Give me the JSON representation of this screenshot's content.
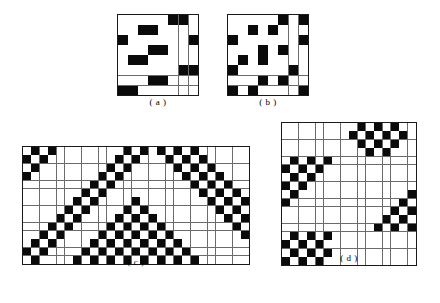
{
  "figure": {
    "background_color": "#ffffff",
    "cell_on_color": "#0a0a0a",
    "cell_off_color": "#ffffff",
    "gridline_color": "#6b6b6b",
    "border_color": "#1a1a1a"
  },
  "panels": [
    {
      "id": "a",
      "caption": "( a )",
      "rows": 8,
      "cols": 8,
      "cell_size": 9.5,
      "matrix": [
        [
          0,
          0,
          0,
          0,
          0,
          1,
          1,
          0
        ],
        [
          0,
          0,
          1,
          1,
          0,
          0,
          0,
          0
        ],
        [
          1,
          0,
          0,
          0,
          0,
          0,
          0,
          1
        ],
        [
          0,
          0,
          0,
          1,
          1,
          0,
          0,
          0
        ],
        [
          0,
          1,
          1,
          0,
          0,
          0,
          0,
          0
        ],
        [
          0,
          0,
          0,
          0,
          0,
          0,
          1,
          1
        ],
        [
          0,
          0,
          0,
          1,
          1,
          0,
          0,
          0
        ],
        [
          1,
          1,
          0,
          0,
          0,
          0,
          0,
          0
        ]
      ]
    },
    {
      "id": "b",
      "caption": "( b )",
      "rows": 8,
      "cols": 8,
      "cell_size": 9.5,
      "matrix": [
        [
          0,
          0,
          0,
          0,
          0,
          1,
          0,
          1
        ],
        [
          0,
          0,
          1,
          0,
          1,
          0,
          0,
          0
        ],
        [
          1,
          0,
          0,
          0,
          0,
          0,
          0,
          1
        ],
        [
          0,
          0,
          0,
          1,
          0,
          1,
          0,
          0
        ],
        [
          0,
          1,
          0,
          1,
          0,
          0,
          0,
          0
        ],
        [
          1,
          0,
          0,
          0,
          0,
          0,
          1,
          0
        ],
        [
          0,
          0,
          0,
          1,
          0,
          1,
          0,
          0
        ],
        [
          1,
          0,
          1,
          0,
          0,
          0,
          0,
          1
        ]
      ]
    },
    {
      "id": "c",
      "caption": "( c )",
      "rows": 14,
      "cols": 27,
      "cell_size": 7.8,
      "matrix": [
        [
          0,
          1,
          0,
          1,
          0,
          0,
          0,
          0,
          0,
          0,
          0,
          0,
          1,
          0,
          1,
          0,
          1,
          0,
          1,
          0,
          1,
          0,
          0,
          0,
          0,
          0,
          0
        ],
        [
          1,
          0,
          1,
          0,
          0,
          0,
          0,
          0,
          0,
          0,
          0,
          1,
          0,
          1,
          0,
          0,
          0,
          1,
          0,
          1,
          0,
          1,
          0,
          0,
          0,
          0,
          0
        ],
        [
          0,
          1,
          0,
          0,
          0,
          0,
          0,
          0,
          0,
          0,
          1,
          0,
          1,
          0,
          0,
          0,
          0,
          0,
          1,
          0,
          1,
          0,
          1,
          0,
          0,
          0,
          0
        ],
        [
          1,
          0,
          0,
          0,
          0,
          0,
          0,
          0,
          0,
          1,
          0,
          1,
          0,
          0,
          0,
          0,
          0,
          0,
          0,
          1,
          0,
          1,
          0,
          1,
          0,
          0,
          0
        ],
        [
          0,
          0,
          0,
          0,
          0,
          0,
          0,
          0,
          1,
          0,
          1,
          0,
          0,
          0,
          0,
          0,
          0,
          0,
          0,
          0,
          1,
          0,
          1,
          0,
          1,
          0,
          0
        ],
        [
          0,
          0,
          0,
          0,
          0,
          0,
          0,
          1,
          0,
          1,
          0,
          0,
          0,
          0,
          0,
          0,
          0,
          0,
          0,
          0,
          0,
          1,
          0,
          1,
          0,
          1,
          0
        ],
        [
          0,
          0,
          0,
          0,
          0,
          0,
          1,
          0,
          1,
          0,
          0,
          0,
          0,
          1,
          0,
          0,
          0,
          0,
          0,
          0,
          0,
          0,
          1,
          0,
          1,
          0,
          1
        ],
        [
          0,
          0,
          0,
          0,
          0,
          1,
          0,
          1,
          0,
          0,
          0,
          0,
          1,
          0,
          1,
          0,
          0,
          0,
          0,
          0,
          0,
          0,
          0,
          1,
          0,
          1,
          0
        ],
        [
          0,
          0,
          0,
          0,
          1,
          0,
          1,
          0,
          0,
          0,
          0,
          1,
          0,
          1,
          0,
          1,
          0,
          0,
          0,
          0,
          0,
          0,
          0,
          0,
          1,
          0,
          1
        ],
        [
          0,
          0,
          0,
          1,
          0,
          1,
          0,
          0,
          0,
          0,
          1,
          0,
          1,
          0,
          1,
          0,
          1,
          0,
          0,
          0,
          0,
          0,
          0,
          0,
          0,
          1,
          0
        ],
        [
          0,
          0,
          1,
          0,
          1,
          0,
          0,
          0,
          0,
          1,
          0,
          1,
          0,
          1,
          0,
          1,
          0,
          1,
          0,
          0,
          0,
          0,
          0,
          0,
          0,
          0,
          1
        ],
        [
          0,
          1,
          0,
          1,
          0,
          0,
          0,
          0,
          1,
          0,
          1,
          0,
          1,
          0,
          1,
          0,
          1,
          0,
          1,
          0,
          0,
          0,
          0,
          0,
          0,
          0,
          0
        ],
        [
          1,
          0,
          1,
          0,
          0,
          0,
          0,
          1,
          0,
          1,
          0,
          1,
          0,
          1,
          0,
          1,
          0,
          1,
          0,
          1,
          0,
          0,
          0,
          0,
          0,
          0,
          0
        ],
        [
          0,
          1,
          0,
          0,
          0,
          0,
          1,
          0,
          1,
          0,
          1,
          0,
          1,
          0,
          1,
          0,
          1,
          0,
          1,
          0,
          1,
          0,
          0,
          0,
          0,
          0,
          0
        ]
      ]
    },
    {
      "id": "d",
      "caption": "( d )",
      "rows": 17,
      "cols": 16,
      "cell_size": 7.8,
      "matrix": [
        [
          0,
          0,
          0,
          0,
          0,
          0,
          0,
          0,
          0,
          1,
          0,
          1,
          0,
          1,
          0,
          0
        ],
        [
          0,
          0,
          0,
          0,
          0,
          0,
          0,
          0,
          1,
          0,
          1,
          0,
          1,
          0,
          1,
          0
        ],
        [
          0,
          0,
          0,
          0,
          0,
          0,
          0,
          0,
          0,
          1,
          0,
          1,
          0,
          1,
          0,
          0
        ],
        [
          0,
          0,
          0,
          0,
          0,
          0,
          0,
          0,
          0,
          0,
          1,
          0,
          1,
          0,
          0,
          0
        ],
        [
          0,
          1,
          0,
          1,
          0,
          1,
          0,
          0,
          0,
          0,
          0,
          0,
          0,
          0,
          0,
          0
        ],
        [
          1,
          0,
          1,
          0,
          1,
          0,
          0,
          0,
          0,
          0,
          0,
          0,
          0,
          0,
          0,
          0
        ],
        [
          0,
          1,
          0,
          1,
          0,
          0,
          0,
          0,
          0,
          0,
          0,
          0,
          0,
          0,
          0,
          0
        ],
        [
          1,
          0,
          1,
          0,
          0,
          0,
          0,
          0,
          0,
          0,
          0,
          0,
          0,
          0,
          0,
          0
        ],
        [
          0,
          1,
          0,
          0,
          0,
          0,
          0,
          0,
          0,
          0,
          0,
          0,
          0,
          0,
          0,
          1
        ],
        [
          1,
          0,
          0,
          0,
          0,
          0,
          0,
          0,
          0,
          0,
          0,
          0,
          0,
          0,
          1,
          0
        ],
        [
          0,
          0,
          0,
          0,
          0,
          0,
          0,
          0,
          0,
          0,
          0,
          0,
          0,
          1,
          0,
          1
        ],
        [
          0,
          0,
          0,
          0,
          0,
          0,
          0,
          0,
          0,
          0,
          0,
          0,
          1,
          0,
          1,
          0
        ],
        [
          0,
          0,
          0,
          0,
          0,
          0,
          0,
          0,
          0,
          0,
          0,
          1,
          0,
          1,
          0,
          1
        ],
        [
          0,
          1,
          0,
          1,
          0,
          1,
          0,
          0,
          0,
          0,
          0,
          0,
          0,
          0,
          0,
          0
        ],
        [
          1,
          0,
          1,
          0,
          1,
          0,
          0,
          0,
          0,
          0,
          0,
          0,
          0,
          0,
          0,
          0
        ],
        [
          0,
          1,
          0,
          1,
          0,
          1,
          0,
          0,
          0,
          0,
          0,
          0,
          0,
          0,
          0,
          0
        ],
        [
          1,
          0,
          1,
          0,
          1,
          0,
          0,
          0,
          0,
          0,
          0,
          0,
          0,
          0,
          0,
          0
        ]
      ]
    }
  ]
}
